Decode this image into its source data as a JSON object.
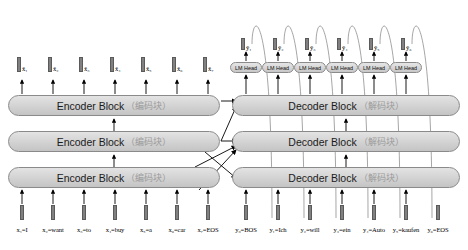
{
  "diagram": {
    "encoder": {
      "block_label": "Encoder Block",
      "block_label_cn": "（编码块）",
      "count": 3,
      "input_tokens": [
        {
          "id": "x1",
          "text": "x₁=I"
        },
        {
          "id": "x2",
          "text": "x₂=want"
        },
        {
          "id": "x3",
          "text": "x₃=to"
        },
        {
          "id": "x4",
          "text": "x₄=buy"
        },
        {
          "id": "x5",
          "text": "x₅=a"
        },
        {
          "id": "x6",
          "text": "x₆=car"
        },
        {
          "id": "x7",
          "text": "x₇=EOS"
        }
      ],
      "output_embeddings": [
        {
          "id": "xb1",
          "text": "x̄₁"
        },
        {
          "id": "xb2",
          "text": "x̄₂"
        },
        {
          "id": "xb3",
          "text": "x̄₃"
        },
        {
          "id": "xb4",
          "text": "x̄₄"
        },
        {
          "id": "xb5",
          "text": "x̄₅"
        },
        {
          "id": "xb6",
          "text": "x̄₆"
        },
        {
          "id": "xb7",
          "text": "x̄₇"
        }
      ]
    },
    "decoder": {
      "block_label": "Decoder Block",
      "block_label_cn": "（解码块）",
      "count": 3,
      "lm_head_label": "LM Head",
      "lm_head_count": 6,
      "input_tokens": [
        {
          "id": "y0",
          "text": "y₀=BOS"
        },
        {
          "id": "y1",
          "text": "y₁=Ich"
        },
        {
          "id": "y2",
          "text": "y₂=will"
        },
        {
          "id": "y3",
          "text": "y₃=ein"
        },
        {
          "id": "y4",
          "text": "y₄=Auto"
        },
        {
          "id": "y5",
          "text": "y₅=kaufen"
        },
        {
          "id": "y6",
          "text": "y₆=EOS"
        }
      ],
      "predictions": [
        {
          "id": "yh1",
          "text": "ŷ₁"
        },
        {
          "id": "yh2",
          "text": "ŷ₂"
        },
        {
          "id": "yh3",
          "text": "ŷ₃"
        },
        {
          "id": "yh4",
          "text": "ŷ₄"
        },
        {
          "id": "yh5",
          "text": "ŷ₅"
        },
        {
          "id": "yh6",
          "text": "ŷ₆"
        }
      ]
    },
    "colors": {
      "block_fill": "#d2d2d2",
      "block_stroke": "#8a8a8a",
      "arrow": "#000000",
      "background": "#ffffff",
      "cn_text": "#9a9a9a"
    }
  }
}
